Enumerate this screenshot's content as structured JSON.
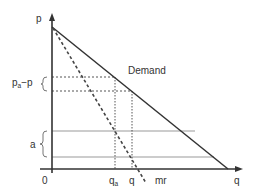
{
  "diagram": {
    "type": "monopoly demand and marginal revenue diagram",
    "axes": {
      "y_label": "p",
      "x_label": "q",
      "origin_label": "0"
    },
    "curves": {
      "demand_label": "Demand",
      "mr_label": "mr"
    },
    "brackets": {
      "price_gap_label_main": "p",
      "price_gap_label_sub": "a",
      "price_gap_label_tail": "−p",
      "area_label": "a"
    },
    "x_ticks": {
      "qa_main": "q",
      "qa_sub": "a",
      "q": "q"
    },
    "colors": {
      "axis": "#333333",
      "demand": "#333333",
      "mr": "#444444",
      "guide_dotted": "#555555",
      "band_lines": "#999999",
      "text": "#333333"
    }
  }
}
